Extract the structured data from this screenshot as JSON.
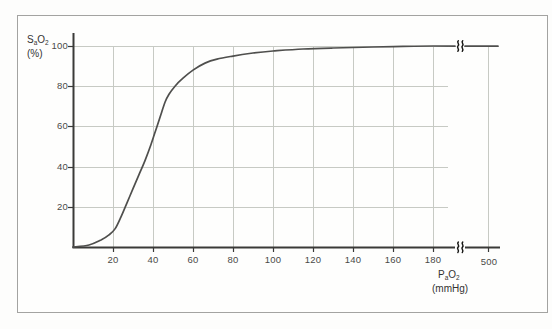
{
  "figure": {
    "y_axis_title": {
      "p1": "S",
      "sub1": "a",
      "p2": "O",
      "sub2": "2",
      "unit": "(%)"
    },
    "x_axis_title": {
      "p1": "P",
      "sub1": "a",
      "p2": "O",
      "sub2": "2",
      "unit": "(mmHg)"
    },
    "colors": {
      "curve": "#4f4f4d",
      "axis": "#3a3a38",
      "grid": "#c7cac4",
      "frame": "#a3a3a1",
      "tick_text": "#4a4a48"
    },
    "break_icon": "axis-break-double-squiggle"
  },
  "chart_data": {
    "type": "line",
    "title": "",
    "xlabel": "PaO2 (mmHg)",
    "ylabel": "SaO2 (%)",
    "ylim": [
      0,
      100
    ],
    "xlim": [
      0,
      500
    ],
    "grid": true,
    "axis_break": {
      "axis": "x",
      "between": [
        190,
        500
      ]
    },
    "x_ticks": [
      20,
      40,
      60,
      80,
      100,
      120,
      140,
      160,
      180,
      500
    ],
    "x_tick_labels": [
      "20",
      "40",
      "60",
      "80",
      "100",
      "120",
      "140",
      "160",
      "180",
      "500"
    ],
    "y_ticks": [
      100,
      80,
      60,
      40,
      20
    ],
    "y_tick_labels": [
      "100",
      "80",
      "60",
      "40",
      "20"
    ],
    "series": [
      {
        "name": "SaO2 vs PaO2 (oxyhemoglobin dissociation curve)",
        "points": [
          [
            0,
            0
          ],
          [
            8,
            1
          ],
          [
            14,
            3.5
          ],
          [
            18,
            6
          ],
          [
            21,
            9
          ],
          [
            24,
            15
          ],
          [
            27,
            22
          ],
          [
            30,
            29
          ],
          [
            33,
            36
          ],
          [
            36,
            43
          ],
          [
            39,
            51
          ],
          [
            42,
            60
          ],
          [
            44,
            66
          ],
          [
            46,
            72
          ],
          [
            48,
            76
          ],
          [
            51,
            80
          ],
          [
            55,
            84
          ],
          [
            60,
            88
          ],
          [
            66,
            91.5
          ],
          [
            72,
            93.5
          ],
          [
            80,
            95
          ],
          [
            90,
            96.5
          ],
          [
            100,
            97.5
          ],
          [
            115,
            98.5
          ],
          [
            130,
            99
          ],
          [
            150,
            99.5
          ],
          [
            165,
            99.8
          ],
          [
            180,
            100
          ],
          [
            500,
            100
          ]
        ]
      }
    ]
  }
}
